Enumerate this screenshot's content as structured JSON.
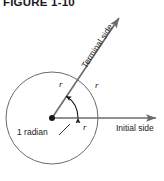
{
  "figure": {
    "caption": "FIGURE 1-10",
    "width": 164,
    "height": 181,
    "background_color": "#ffffff",
    "stroke_color": "#6b6b6b",
    "text_color": "#1a1a1a"
  },
  "labels": {
    "terminal_side": "Terminal side",
    "initial_side": "Initial side",
    "angle_measure": "1 radian",
    "radius_terminal": "r",
    "radius_arc": "r",
    "radius_initial": "r"
  },
  "geometry": {
    "center_x": 52,
    "center_y": 118,
    "circle_radius": 46,
    "vertex_dot_radius": 3,
    "initial_ray": {
      "from_x": 52,
      "from_y": 118,
      "to_x": 160,
      "to_y": 118
    },
    "terminal_ray": {
      "from_x": 52,
      "from_y": 118,
      "to_x": 122,
      "to_y": 14,
      "angle_degrees": 57
    },
    "angle_arc_radius": 26
  },
  "icons": {
    "vertex": "vertex-dot-icon",
    "initial_arrow": "arrowhead-icon",
    "terminal_arrow": "arrowhead-icon",
    "angle_arc": "double-arrow-arc-icon",
    "leader": "leader-line-icon"
  }
}
